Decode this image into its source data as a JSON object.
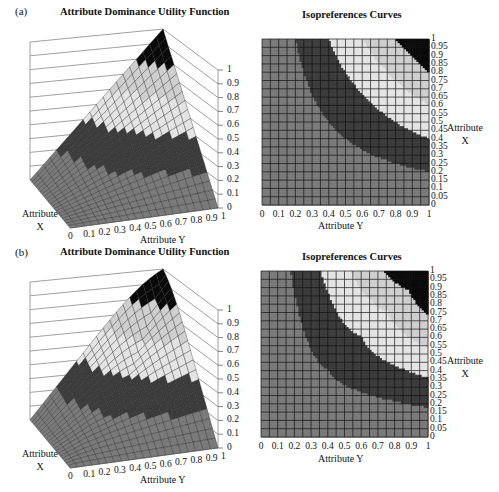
{
  "figure": {
    "panels": [
      {
        "tag": "(a)",
        "surface_title": "Attribute Dominance Utility Function",
        "contour_title": "Isopreferences Curves",
        "x_axis_label": "Attribute\nX",
        "y_axis_label": "Attribute Y"
      },
      {
        "tag": "(b)",
        "surface_title": "Attribute Dominance Utility Function",
        "contour_title": "Isopreferences Curves",
        "x_axis_label": "Attribute\nX",
        "y_axis_label": "Attribute Y"
      }
    ],
    "z_ticks": [
      "0",
      "0.1",
      "0.2",
      "0.3",
      "0.4",
      "0.5",
      "0.6",
      "0.7",
      "0.8",
      "0.9",
      "1"
    ],
    "y_ticks": [
      "0",
      "0.1",
      "0.2",
      "0.3",
      "0.4",
      "0.5",
      "0.6",
      "0.7",
      "0.8",
      "0.9",
      "1"
    ],
    "x_ticks_contour": [
      "0",
      "0.05",
      "0.1",
      "0.15",
      "0.2",
      "0.25",
      "0.3",
      "0.35",
      "0.4",
      "0.45",
      "0.5",
      "0.55",
      "0.6",
      "0.65",
      "0.7",
      "0.75",
      "0.8",
      "0.85",
      "0.9",
      "0.95",
      "1"
    ],
    "colors": {
      "band_0": "#7a7a7a",
      "band_1": "#3c3c3c",
      "band_2": "#e4e4e4",
      "band_3": "#cfcfcf",
      "band_4": "#0a0a0a",
      "grid": "#111111"
    }
  },
  "chart_data": [
    {
      "type": "surface3d",
      "title": "Attribute Dominance Utility Function",
      "panel": "(a)",
      "xlabel": "Attribute X",
      "ylabel": "Attribute Y",
      "zlabel": "",
      "x_ticks": [
        0,
        1
      ],
      "y_ticks": [
        0,
        0.1,
        0.2,
        0.3,
        0.4,
        0.5,
        0.6,
        0.7,
        0.8,
        0.9,
        1
      ],
      "z_ticks": [
        0,
        0.1,
        0.2,
        0.3,
        0.4,
        0.5,
        0.6,
        0.7,
        0.8,
        0.9,
        1
      ],
      "zlim": [
        0,
        1
      ],
      "function_hint": "u(x,y) ≈ x·y (bilinear utility, max 1 at x=y=1)"
    },
    {
      "type": "heatmap",
      "title": "Isopreferences Curves",
      "panel": "(a)",
      "xlabel": "Attribute Y",
      "ylabel": "Attribute X",
      "x_ticks": [
        0,
        0.1,
        0.2,
        0.3,
        0.4,
        0.5,
        0.6,
        0.7,
        0.8,
        0.9,
        1
      ],
      "y_ticks": [
        0,
        0.05,
        0.1,
        0.15,
        0.2,
        0.25,
        0.3,
        0.35,
        0.4,
        0.45,
        0.5,
        0.55,
        0.6,
        0.65,
        0.7,
        0.75,
        0.8,
        0.85,
        0.9,
        0.95,
        1
      ],
      "contour_levels": [
        0.2,
        0.4,
        0.6,
        0.8
      ],
      "bands": [
        "0-0.2",
        "0.2-0.4",
        "0.4-0.6",
        "0.6-0.8",
        "0.8-1"
      ],
      "grid": true
    },
    {
      "type": "surface3d",
      "title": "Attribute Dominance Utility Function",
      "panel": "(b)",
      "xlabel": "Attribute X",
      "ylabel": "Attribute Y",
      "x_ticks": [
        0,
        1
      ],
      "y_ticks": [
        0,
        0.1,
        0.2,
        0.3,
        0.4,
        0.5,
        0.6,
        0.7,
        0.8,
        0.9,
        1
      ],
      "z_ticks": [
        0,
        0.1,
        0.2,
        0.3,
        0.4,
        0.5,
        0.6,
        0.7,
        0.8,
        0.9,
        1
      ],
      "zlim": [
        0,
        1
      ],
      "function_hint": "u(x,y) ≈ min-type (Leontief-like) utility, max 1 at x=y=1"
    },
    {
      "type": "heatmap",
      "title": "Isopreferences Curves",
      "panel": "(b)",
      "xlabel": "Attribute Y",
      "ylabel": "Attribute X",
      "x_ticks": [
        0,
        0.1,
        0.2,
        0.3,
        0.4,
        0.5,
        0.6,
        0.7,
        0.8,
        0.9,
        1
      ],
      "y_ticks": [
        0,
        0.05,
        0.1,
        0.15,
        0.2,
        0.25,
        0.3,
        0.35,
        0.4,
        0.45,
        0.5,
        0.55,
        0.6,
        0.65,
        0.7,
        0.75,
        0.8,
        0.85,
        0.9,
        0.95,
        1
      ],
      "contour_levels": [
        0.2,
        0.4,
        0.6,
        0.8
      ],
      "bands": [
        "0-0.2",
        "0.2-0.4",
        "0.4-0.6",
        "0.6-0.8",
        "0.8-1"
      ],
      "grid": true
    }
  ]
}
